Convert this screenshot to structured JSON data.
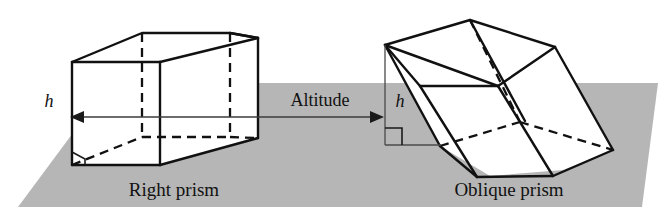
{
  "figure": {
    "background_color": "#ffffff",
    "plane_color": "#b6b6b6",
    "edge_color": "#111111",
    "face_color": "#ffffff"
  },
  "labels": {
    "right_prism_caption": "Right prism",
    "oblique_prism_caption": "Oblique prism",
    "altitude_label": "Altitude",
    "height_left": "h",
    "height_right": "h"
  },
  "annotations": {
    "right_angle_marker_left": "right-angle",
    "right_angle_marker_right": "right-angle",
    "arrow_left_direction": "left",
    "arrow_right_direction": "right"
  },
  "geometry": {
    "plane": {
      "type": "parallelogram",
      "points": "18,207 642,207 658,83 110,83"
    },
    "right_prism": {
      "type": "rectangular-prism",
      "front_face": "72,62 160,62 160,165 72,165",
      "top_back_left": "142,33",
      "top_back_right": "230,33",
      "right_top_front": "160,62",
      "right_top_back": "258,38",
      "right_bottom_back": "258,138",
      "hidden_vertex_back_bottom_left": "142,137",
      "hidden_vertex_back_bottom_right": "230,137"
    },
    "oblique_prism": {
      "type": "pentagonal-prism",
      "apex_top": "470,20",
      "left_vertex": "385,45",
      "base_left": "385,145"
    },
    "altitude_connector": {
      "left_arrow_tip": "72,117",
      "right_arrow_tip": "382,117",
      "line_y": 117
    }
  }
}
